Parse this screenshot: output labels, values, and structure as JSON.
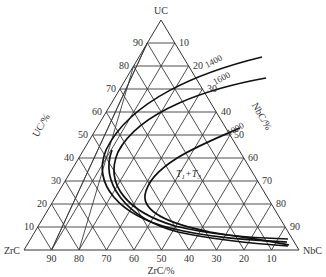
{
  "diagram": {
    "type": "ternary",
    "vertices": {
      "top": "UC",
      "bottom_left": "ZrC",
      "bottom_right": "NbC"
    },
    "axis_titles": {
      "left": "UC/%",
      "right": "NbC/%",
      "bottom": "ZrC/%"
    },
    "left_ticks": [
      "90",
      "80",
      "70",
      "60",
      "50",
      "40",
      "30",
      "20",
      "10"
    ],
    "right_ticks": [
      "10",
      "20",
      "30",
      "40",
      "50",
      "60",
      "70",
      "80",
      "90"
    ],
    "bottom_ticks": [
      "90",
      "80",
      "70",
      "60",
      "50",
      "40",
      "30",
      "20",
      "10"
    ],
    "isotherm_labels": {
      "t1400": "1400",
      "t1600": "1600",
      "t1000": "1000"
    },
    "region_label": {
      "t1": "T",
      "sub1": "1",
      "plus": "+T",
      "sub2": "3"
    }
  }
}
